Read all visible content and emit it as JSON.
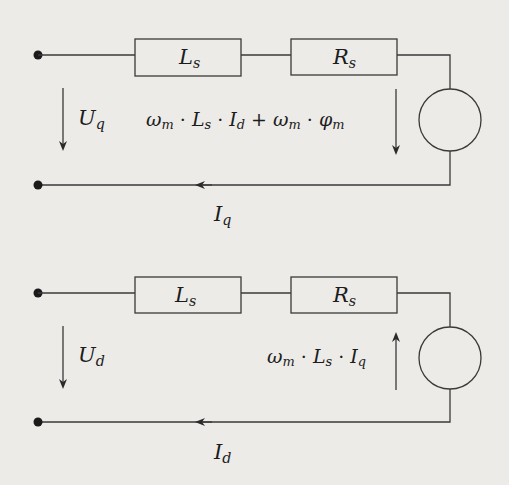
{
  "diagram": {
    "type": "equivalent-circuit",
    "colors": {
      "background": "#ecebe8",
      "line": "#3a3a3a",
      "text": "#1c1c1c"
    },
    "q_axis": {
      "inductor": {
        "symbol": "L",
        "sub": "s"
      },
      "resistor": {
        "symbol": "R",
        "sub": "s"
      },
      "voltage": {
        "symbol": "U",
        "sub": "q",
        "arrow": "down"
      },
      "current": {
        "symbol": "I",
        "sub": "q",
        "arrow": "left"
      },
      "emf": {
        "t1": "ω",
        "t1sub": "m",
        "dot1": " · ",
        "t2": "L",
        "t2sub": "s",
        "dot2": " · ",
        "t3": "I",
        "t3sub": "d",
        "plus": " + ",
        "t4": "ω",
        "t4sub": "m",
        "dot3": " · ",
        "t5": "φ",
        "t5sub": "m",
        "arrow": "down"
      }
    },
    "d_axis": {
      "inductor": {
        "symbol": "L",
        "sub": "s"
      },
      "resistor": {
        "symbol": "R",
        "sub": "s"
      },
      "voltage": {
        "symbol": "U",
        "sub": "d",
        "arrow": "down"
      },
      "current": {
        "symbol": "I",
        "sub": "d",
        "arrow": "left"
      },
      "emf": {
        "t1": "ω",
        "t1sub": "m",
        "dot1": " · ",
        "t2": "L",
        "t2sub": "s",
        "dot2": " · ",
        "t3": "I",
        "t3sub": "q",
        "arrow": "up"
      }
    }
  }
}
